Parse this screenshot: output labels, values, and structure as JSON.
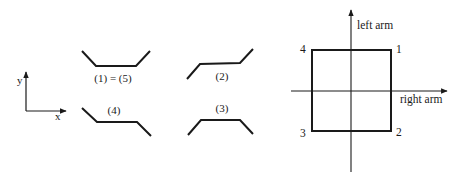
{
  "left_panel": {
    "axes": {
      "x_label": "x",
      "y_label": "y"
    },
    "shapes": [
      {
        "label": "(1) = (5)",
        "points": "82,51 96,66 136,66 150,51",
        "label_pos": [
          113,
          81
        ]
      },
      {
        "label": "(2)",
        "points": "187,79 200,64 240,63 253,49",
        "label_pos": [
          222,
          79
        ]
      },
      {
        "label": "(3)",
        "points": "188,135 201,120 240,120 253,134",
        "label_pos": [
          222,
          111
        ]
      },
      {
        "label": "(4)",
        "points": "82,108 97,122 137,122 151,136",
        "label_pos": [
          114,
          114
        ]
      }
    ]
  },
  "right_panel": {
    "vertical_axis_label": "left arm",
    "horizontal_axis_label": "right arm",
    "corners": [
      {
        "label": "1",
        "x": 396,
        "y": 53
      },
      {
        "label": "2",
        "x": 396,
        "y": 136
      },
      {
        "label": "3",
        "x": 301,
        "y": 137
      },
      {
        "label": "4",
        "x": 301,
        "y": 53
      }
    ]
  }
}
